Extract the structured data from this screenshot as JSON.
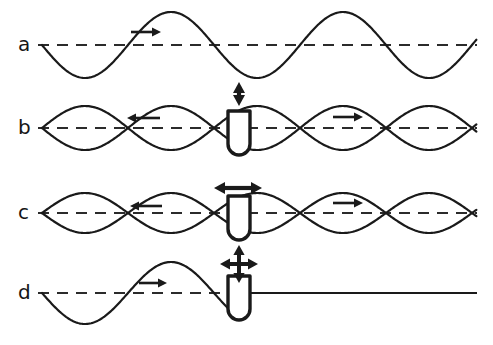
{
  "figure": {
    "width": 493,
    "height": 345,
    "background_color": "#ffffff",
    "stroke_color": "#1a1a1a",
    "dash_color": "#2b2b2b"
  },
  "rows": [
    {
      "id": "a",
      "label": "a",
      "label_x": 18,
      "label_y": 34,
      "baseline_y": 45,
      "caption": "free travelling wave, no buoy",
      "wave": {
        "kind": "travelling",
        "start_x": 42,
        "end_x": 477,
        "amplitude": 33,
        "wavelength": 172,
        "phase_deg": 180,
        "direction": "right"
      },
      "second_wave": null,
      "buoy": null,
      "motion_arrow": null,
      "wave_arrows": [
        {
          "name": "wave-direction-arrow-right",
          "direction": "right",
          "x": 131,
          "y": 32,
          "length": 30
        }
      ]
    },
    {
      "id": "b",
      "label": "b",
      "label_x": 18,
      "label_y": 117,
      "baseline_y": 128,
      "caption": "buoy heaving vertically, waves radiate both ways",
      "wave": {
        "kind": "standing-pair",
        "start_x": 42,
        "end_x": 477,
        "amplitude": 22,
        "wavelength": 172,
        "phase_deg": 180,
        "direction": "right"
      },
      "second_wave": {
        "kind": "mirror",
        "amplitude": 22,
        "wavelength": 172,
        "phase_deg": 0,
        "direction": "left"
      },
      "buoy": {
        "center_x": 239,
        "top_y": 111,
        "width": 22,
        "height": 44
      },
      "motion_arrow": {
        "name": "vertical-double-arrow",
        "type": "double-vertical",
        "center_x": 239,
        "top_y": 82,
        "bottom_y": 106
      },
      "wave_arrows": [
        {
          "name": "wave-direction-arrow-left",
          "direction": "left",
          "x": 127,
          "y": 118,
          "length": 33
        },
        {
          "name": "wave-direction-arrow-right",
          "direction": "right",
          "x": 333,
          "y": 117,
          "length": 30
        }
      ]
    },
    {
      "id": "c",
      "label": "c",
      "label_x": 18,
      "label_y": 202,
      "baseline_y": 213,
      "caption": "buoy surging horizontally, waves radiate both ways",
      "wave": {
        "kind": "standing-pair",
        "start_x": 42,
        "end_x": 477,
        "amplitude": 20,
        "wavelength": 172,
        "phase_deg": 0,
        "direction": "right"
      },
      "second_wave": {
        "kind": "mirror",
        "amplitude": 20,
        "wavelength": 172,
        "phase_deg": 180,
        "direction": "left"
      },
      "buoy": {
        "center_x": 239,
        "top_y": 196,
        "width": 22,
        "height": 44
      },
      "motion_arrow": {
        "name": "horizontal-double-arrow",
        "type": "double-horizontal",
        "center_y": 188,
        "left_x": 214,
        "right_x": 262
      },
      "wave_arrows": [
        {
          "name": "wave-direction-arrow-left",
          "direction": "left",
          "x": 130,
          "y": 206,
          "length": 32
        },
        {
          "name": "wave-direction-arrow-right",
          "direction": "right",
          "x": 333,
          "y": 203,
          "length": 30
        }
      ]
    },
    {
      "id": "d",
      "label": "d",
      "label_x": 18,
      "label_y": 282,
      "baseline_y": 293,
      "caption": "incident wave fully absorbed by buoy, calm water behind",
      "wave": {
        "kind": "absorbed",
        "start_x": 42,
        "end_x": 477,
        "amplitude": 31,
        "wavelength": 172,
        "phase_deg": 180,
        "direction": "right",
        "absorb_x": 230
      },
      "second_wave": null,
      "buoy": {
        "center_x": 239,
        "top_y": 276,
        "width": 22,
        "height": 44
      },
      "motion_arrow": {
        "name": "four-way-arrow",
        "type": "cross",
        "center_x": 239,
        "center_y": 264,
        "arm": 19
      },
      "wave_arrows": [
        {
          "name": "wave-direction-arrow-right",
          "direction": "right",
          "x": 139,
          "y": 283,
          "length": 28
        }
      ]
    }
  ]
}
